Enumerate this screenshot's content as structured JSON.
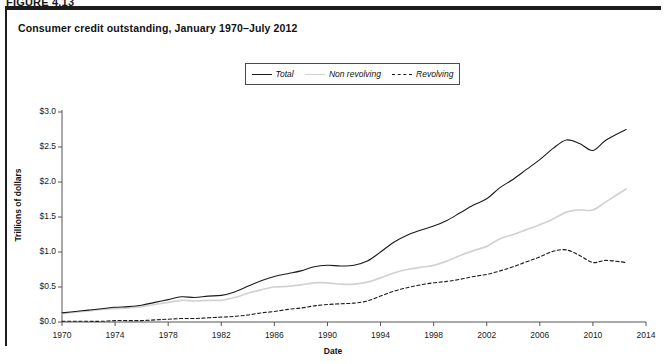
{
  "figure": {
    "label": "FIGURE 4.13"
  },
  "chart_title": "Consumer credit outstanding, January 1970–July 2012",
  "axes": {
    "ylabel": "Trillions of dollars",
    "xlabel": "Date",
    "yticks": [
      "$0.0",
      "$0.5",
      "$1.0",
      "$1.5",
      "$2.0",
      "$2.5",
      "$3.0"
    ],
    "xticks": [
      "1970",
      "1974",
      "1978",
      "1982",
      "1986",
      "1990",
      "1994",
      "1998",
      "2002",
      "2006",
      "2010",
      "2014"
    ]
  },
  "legend": {
    "items": [
      {
        "label": "Total",
        "style": "solid-dark",
        "color": "#1a1a1a"
      },
      {
        "label": "Non revolving",
        "style": "solid-light",
        "color": "#d2d2d2"
      },
      {
        "label": "Revolving",
        "style": "dashed-dark",
        "color": "#1a1a1a"
      }
    ]
  },
  "chart_data": {
    "type": "line",
    "title": "Consumer credit outstanding, January 1970–July 2012",
    "xlabel": "Date",
    "ylabel": "Trillions of dollars",
    "xlim": [
      1970,
      2014
    ],
    "ylim": [
      0.0,
      3.0
    ],
    "ytick_values": [
      0.0,
      0.5,
      1.0,
      1.5,
      2.0,
      2.5,
      3.0
    ],
    "xtick_values": [
      1970,
      1974,
      1978,
      1982,
      1986,
      1990,
      1994,
      1998,
      2002,
      2006,
      2010,
      2014
    ],
    "grid": false,
    "legend_position": "top-center",
    "x": [
      1970,
      1971,
      1972,
      1973,
      1974,
      1975,
      1976,
      1977,
      1978,
      1979,
      1980,
      1981,
      1982,
      1983,
      1984,
      1985,
      1986,
      1987,
      1988,
      1989,
      1990,
      1991,
      1992,
      1993,
      1994,
      1995,
      1996,
      1997,
      1998,
      1999,
      2000,
      2001,
      2002,
      2003,
      2004,
      2005,
      2006,
      2007,
      2008,
      2009,
      2010,
      2011,
      2012.5
    ],
    "series": [
      {
        "name": "Total",
        "color": "#1a1a1a",
        "dash": "solid",
        "values": [
          0.13,
          0.15,
          0.17,
          0.19,
          0.21,
          0.22,
          0.24,
          0.28,
          0.32,
          0.36,
          0.35,
          0.37,
          0.38,
          0.43,
          0.51,
          0.59,
          0.65,
          0.69,
          0.73,
          0.79,
          0.81,
          0.8,
          0.81,
          0.87,
          1.0,
          1.14,
          1.24,
          1.31,
          1.37,
          1.45,
          1.56,
          1.67,
          1.76,
          1.92,
          2.04,
          2.18,
          2.32,
          2.48,
          2.6,
          2.55,
          2.45,
          2.6,
          2.75
        ]
      },
      {
        "name": "Non revolving",
        "color": "#d2d2d2",
        "dash": "solid",
        "values": [
          0.12,
          0.14,
          0.16,
          0.18,
          0.19,
          0.2,
          0.22,
          0.25,
          0.28,
          0.31,
          0.3,
          0.31,
          0.31,
          0.35,
          0.41,
          0.46,
          0.5,
          0.51,
          0.53,
          0.56,
          0.56,
          0.54,
          0.54,
          0.57,
          0.63,
          0.7,
          0.75,
          0.78,
          0.81,
          0.87,
          0.95,
          1.02,
          1.08,
          1.19,
          1.25,
          1.32,
          1.39,
          1.47,
          1.57,
          1.6,
          1.6,
          1.72,
          1.9
        ]
      },
      {
        "name": "Revolving",
        "color": "#1a1a1a",
        "dash": "dashed",
        "values": [
          0.01,
          0.01,
          0.01,
          0.01,
          0.02,
          0.02,
          0.02,
          0.03,
          0.04,
          0.05,
          0.05,
          0.06,
          0.07,
          0.08,
          0.1,
          0.13,
          0.15,
          0.18,
          0.2,
          0.23,
          0.25,
          0.26,
          0.27,
          0.3,
          0.37,
          0.44,
          0.49,
          0.53,
          0.56,
          0.58,
          0.61,
          0.65,
          0.68,
          0.73,
          0.79,
          0.86,
          0.93,
          1.01,
          1.03,
          0.95,
          0.85,
          0.88,
          0.85
        ]
      }
    ]
  }
}
